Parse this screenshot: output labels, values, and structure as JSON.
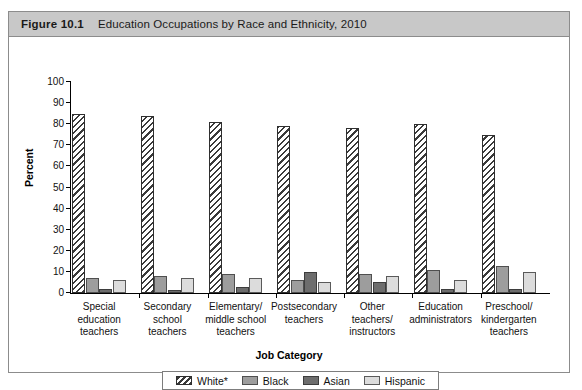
{
  "figure": {
    "number": "Figure 10.1",
    "caption": "Education Occupations by Race and Ethnicity, 2010"
  },
  "chart_data": {
    "type": "bar",
    "title": "Education Occupations by Race and Ethnicity, 2010",
    "xlabel": "Job Category",
    "ylabel": "Percent",
    "ylim": [
      0,
      100
    ],
    "yticks": [
      0,
      10,
      20,
      30,
      40,
      50,
      60,
      70,
      80,
      90,
      100
    ],
    "grid": false,
    "legend_position": "bottom",
    "categories": [
      "Special\neducation\nteachers",
      "Secondary\nschool\nteachers",
      "Elementary/\nmiddle school\nteachers",
      "Postsecondary\nteachers",
      "Other\nteachers/\ninstructors",
      "Education\nadministrators",
      "Preschool/\nkindergarten\nteachers"
    ],
    "series": [
      {
        "name": "White*",
        "color": "#ffffff",
        "pattern": "diagonal-hatch",
        "values": [
          85,
          84,
          81,
          79,
          78,
          80,
          75
        ]
      },
      {
        "name": "Black",
        "color": "#9d9d9d",
        "pattern": "solid",
        "values": [
          7,
          8,
          9,
          6,
          9,
          11,
          13
        ]
      },
      {
        "name": "Asian",
        "color": "#6d6d6d",
        "pattern": "solid",
        "values": [
          2,
          1.5,
          3,
          10,
          5,
          2,
          2
        ]
      },
      {
        "name": "Hispanic",
        "color": "#dcdcdc",
        "pattern": "solid",
        "values": [
          6,
          7,
          7,
          5,
          8,
          6,
          10
        ]
      }
    ]
  }
}
